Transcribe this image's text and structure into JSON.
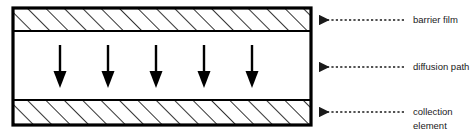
{
  "diagram": {
    "colors": {
      "stroke": "#000000",
      "fill": "#ffffff",
      "hatch": "#000000",
      "text": "#1a1a1a",
      "leader": "#1a1a1a"
    },
    "cell": {
      "x": 13,
      "y": 8,
      "width": 298,
      "height": 117,
      "border_width": 3
    },
    "layers": [
      {
        "name": "barrier-film",
        "style": "hatched",
        "y": 8,
        "height": 23,
        "hatch_angle_deg": 45,
        "hatch_spacing": 13
      },
      {
        "name": "diffusion-path",
        "style": "plain",
        "y": 31,
        "height": 69
      },
      {
        "name": "collection-element",
        "style": "hatched",
        "y": 100,
        "height": 25,
        "hatch_angle_deg": 45,
        "hatch_spacing": 13
      }
    ],
    "flow_arrows": {
      "name": "diffusion-direction-arrows",
      "count": 5,
      "direction": "down",
      "x_positions": [
        60,
        108,
        156,
        204,
        252
      ],
      "y_top": 45,
      "y_bottom": 88,
      "shaft_width": 2.4,
      "head_width": 13,
      "head_height": 17
    },
    "callouts": [
      {
        "name": "barrier-film",
        "label": "barrier film",
        "lines": [
          "barrier film"
        ],
        "leader_y": 20,
        "leader_x_start": 404,
        "leader_x_end": 318,
        "text_x": 413,
        "text_y": 20
      },
      {
        "name": "diffusion-path",
        "label": "diffusion path",
        "lines": [
          "diffusion path"
        ],
        "leader_y": 67,
        "leader_x_start": 404,
        "leader_x_end": 318,
        "text_x": 413,
        "text_y": 67
      },
      {
        "name": "collection-element",
        "label": "collection element",
        "lines": [
          "collection",
          "element"
        ],
        "leader_y": 112,
        "leader_x_start": 404,
        "leader_x_end": 318,
        "text_x": 413,
        "text_y": 112
      }
    ]
  }
}
